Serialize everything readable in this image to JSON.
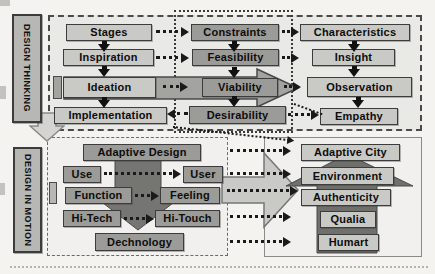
{
  "sidebar_labels": {
    "top": "DESIGN THINKING",
    "bottom": "DESIGN IN MOTION"
  },
  "design_thinking": {
    "process": [
      "Stages",
      "Inspiration",
      "Ideation",
      "Implementation"
    ],
    "evaluation": [
      "Constraints",
      "Feasibility",
      "Viability",
      "Desirability"
    ],
    "understanding": [
      "Characteristics",
      "Insight",
      "Observation",
      "Empathy"
    ]
  },
  "design_in_motion": {
    "header": "Adaptive Design",
    "pairs": [
      {
        "from": "Use",
        "to": "User"
      },
      {
        "from": "Function",
        "to": "Feeling"
      },
      {
        "from": "Hi-Tech",
        "to": "Hi-Touch"
      }
    ],
    "footer": "Dechnology",
    "goals": [
      "Adaptive City",
      "Environment",
      "Authenticity",
      "Qualia",
      "Humart"
    ]
  },
  "colors": {
    "box_light": "#c9c9c6",
    "box_dark": "#9b9b98",
    "big_arrow_gray": "#a3a3a0",
    "big_arrow_light": "#c9c9c6",
    "block_arrow_dark": "#757572",
    "section_bg": "#e9e9e6"
  }
}
